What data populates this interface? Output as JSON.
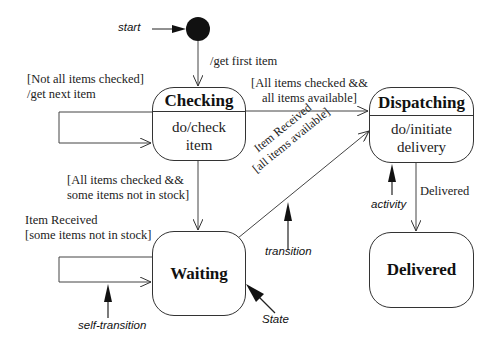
{
  "diagram": {
    "type": "UML state machine",
    "initial_node": {
      "label": "start",
      "transition_label": "/get first item"
    },
    "states": [
      {
        "id": "checking",
        "name": "Checking",
        "activity_line1": "do/check",
        "activity_line2": "item"
      },
      {
        "id": "dispatching",
        "name": "Dispatching",
        "activity_line1": "do/initiate",
        "activity_line2": "delivery"
      },
      {
        "id": "waiting",
        "name": "Waiting"
      },
      {
        "id": "delivered",
        "name": "Delivered"
      }
    ],
    "transitions": {
      "checking_self": {
        "line1": "[Not all items checked]",
        "line2": "/get next item"
      },
      "checking_to_dispatching": {
        "line1": "[All items checked &&",
        "line2": "all items available]"
      },
      "checking_to_waiting": {
        "line1": "[All items checked &&",
        "line2": "some items not in stock]"
      },
      "waiting_self": {
        "line1": "Item Received",
        "line2": "[some items not in stock]"
      },
      "waiting_to_dispatching": {
        "line1": "Item Received",
        "line2": "[all items available]"
      },
      "dispatching_to_delivered": {
        "label": "Delivered"
      }
    },
    "annotations": {
      "activity": "activity",
      "transition": "transition",
      "self_transition": "self-transition",
      "state": "State"
    }
  }
}
